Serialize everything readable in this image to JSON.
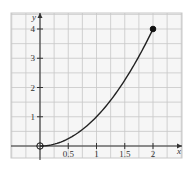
{
  "chart_data": {
    "type": "line",
    "title": "",
    "xlabel": "x",
    "ylabel": "y",
    "function": "y = x^2",
    "x": [
      0,
      0.25,
      0.5,
      0.75,
      1,
      1.25,
      1.5,
      1.75,
      2
    ],
    "series": [
      {
        "name": "y = x^2",
        "values": [
          0,
          0.0625,
          0.25,
          0.5625,
          1,
          1.5625,
          2.25,
          3.0625,
          4
        ]
      }
    ],
    "endpoints": [
      {
        "x": 0,
        "y": 0,
        "style": "open"
      },
      {
        "x": 2,
        "y": 4,
        "style": "closed"
      }
    ],
    "x_ticks": [
      "0.5",
      "1",
      "1.5",
      "2"
    ],
    "y_ticks": [
      "1",
      "2",
      "3",
      "4"
    ],
    "xlim": [
      -0.5,
      2.5
    ],
    "ylim": [
      -0.4,
      4.5
    ],
    "grid": true,
    "colors": {
      "grid": "#c8c8c8",
      "axis": "#333333",
      "curve": "#222222",
      "background": "#f4f4f4"
    }
  }
}
